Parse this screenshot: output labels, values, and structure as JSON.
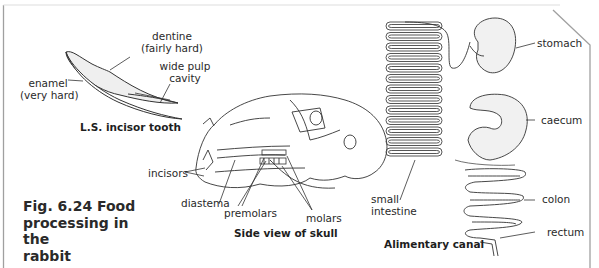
{
  "figure": {
    "number": "Fig. 6.24",
    "title_line1": "Fig. 6.24  Food",
    "title_line2": "processing in the",
    "title_line3": "rabbit"
  },
  "tooth": {
    "caption": "L.S. incisor tooth",
    "labels": {
      "dentine_1": "dentine",
      "dentine_2": "(fairly hard)",
      "pulp_1": "wide pulp",
      "pulp_2": "cavity",
      "enamel_1": "enamel",
      "enamel_2": "(very hard)"
    }
  },
  "skull": {
    "caption": "Side view of skull",
    "labels": {
      "incisors": "incisors",
      "diastema": "diastema",
      "premolars": "premolars",
      "molars": "molars"
    }
  },
  "canal": {
    "caption": "Alimentary canal",
    "labels": {
      "stomach": "stomach",
      "caecum": "caecum",
      "colon": "colon",
      "rectum": "rectum",
      "small_intestine_1": "small",
      "small_intestine_2": "intestine"
    }
  },
  "colors": {
    "line": "#3a3a3a",
    "frame": "#9a9a9a",
    "fill": "#f1f1f1"
  }
}
